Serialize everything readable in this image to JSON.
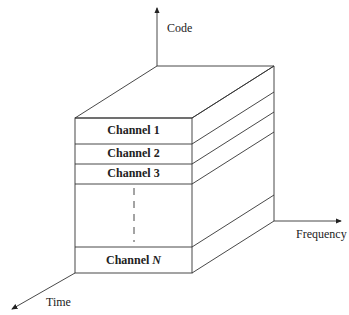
{
  "diagram": {
    "type": "3d-block",
    "axes": {
      "vertical": "Code",
      "horizontal": "Frequency",
      "depth": "Time"
    },
    "channels": [
      {
        "label": "Channel 1"
      },
      {
        "label": "Channel 2"
      },
      {
        "label": "Channel 3"
      },
      {
        "label": "Channel ",
        "suffix": "N"
      }
    ],
    "colors": {
      "line": "#333333",
      "background": "#ffffff"
    }
  }
}
